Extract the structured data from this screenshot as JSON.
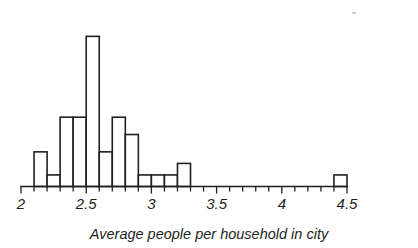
{
  "chart_data": {
    "type": "bar",
    "chart_subtype": "histogram",
    "title": "",
    "subtitle": "",
    "xlabel": "Average people per household in city",
    "ylabel": "",
    "xlim": [
      2,
      4.5
    ],
    "ylim": [
      0,
      13
    ],
    "bin_width": 0.1,
    "grid": false,
    "legend": null,
    "x_ticks": [
      2,
      2.5,
      3,
      3.5,
      4,
      4.5
    ],
    "x_tick_labels": [
      "2",
      "2.5",
      "3",
      "3.5",
      "4",
      "4.5"
    ],
    "minor_tick_step": 0.1,
    "y_axis_visible": false,
    "bin_starts": [
      2.1,
      2.2,
      2.3,
      2.4,
      2.5,
      2.6,
      2.7,
      2.8,
      2.9,
      3.0,
      3.1,
      3.2,
      4.4
    ],
    "bin_ends": [
      2.2,
      2.3,
      2.4,
      2.5,
      2.6,
      2.7,
      2.8,
      2.9,
      3.0,
      3.1,
      3.2,
      3.3,
      4.5
    ],
    "values": [
      3,
      1,
      6,
      6,
      13,
      3,
      6,
      4.5,
      1,
      1,
      1,
      2,
      1
    ],
    "categories": [
      "2.1-2.2",
      "2.2-2.3",
      "2.3-2.4",
      "2.4-2.5",
      "2.5-2.6",
      "2.6-2.7",
      "2.7-2.8",
      "2.8-2.9",
      "2.9-3.0",
      "3.0-3.1",
      "3.1-3.2",
      "3.2-3.3",
      "4.4-4.5"
    ],
    "colors": {
      "bar_fill": "#ffffff",
      "bar_stroke": "#231f20",
      "axis": "#231f20",
      "text": "#231f20",
      "background": "#ffffff"
    }
  },
  "figure": {
    "axis_label": "Average people per household in city",
    "tick_labels": [
      "2",
      "2.5",
      "3",
      "3.5",
      "4",
      "4.5"
    ]
  }
}
